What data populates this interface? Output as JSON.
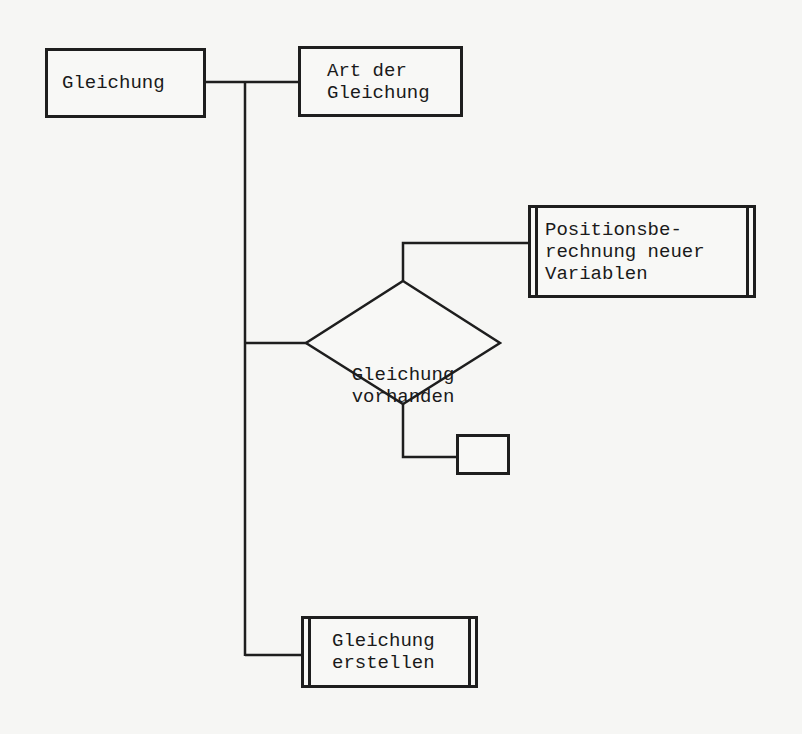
{
  "diagram": {
    "type": "structure-chart",
    "nodes": {
      "gleichung": {
        "label": "Gleichung",
        "kind": "process"
      },
      "art_der_gleichung": {
        "label": "Art der\nGleichung",
        "kind": "process"
      },
      "positionsberechnung": {
        "label": "Positionsbe-\nrechnung neuer\nVariablen",
        "kind": "subroutine"
      },
      "gleichung_vorhanden": {
        "label": "Gleichung\nvorhanden",
        "kind": "decision"
      },
      "empty_box": {
        "label": "",
        "kind": "process"
      },
      "gleichung_erstellen": {
        "label": "Gleichung\nerstellen",
        "kind": "subroutine"
      }
    },
    "edges": [
      {
        "from": "gleichung",
        "to": "art_der_gleichung"
      },
      {
        "from": "gleichung",
        "to": "gleichung_vorhanden"
      },
      {
        "from": "gleichung",
        "to": "gleichung_erstellen"
      },
      {
        "from": "gleichung_vorhanden",
        "to": "positionsberechnung"
      },
      {
        "from": "gleichung_vorhanden",
        "to": "empty_box"
      }
    ],
    "colors": {
      "line": "#1e1e1e",
      "background": "#f6f6f4"
    }
  }
}
